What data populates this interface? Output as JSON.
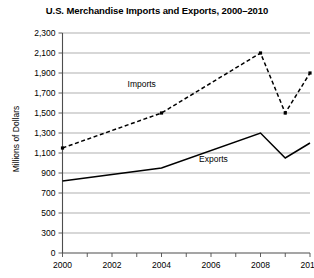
{
  "chart_data": {
    "type": "line",
    "title": "U.S. Merchandise Imports and Exports, 2000–2010",
    "xlabel": "",
    "ylabel": "Millions of Dollars",
    "x": [
      2000,
      2004,
      2008,
      2009,
      2010
    ],
    "series": [
      {
        "name": "Imports",
        "style": "dashed",
        "values": [
          1150,
          1500,
          2100,
          1500,
          1900
        ]
      },
      {
        "name": "Exports",
        "style": "solid",
        "values": [
          820,
          950,
          1300,
          1050,
          1200
        ]
      }
    ],
    "ylim": [
      0,
      2300
    ],
    "yticks": [
      0,
      300,
      500,
      700,
      900,
      1100,
      1300,
      1500,
      1700,
      1900,
      2100,
      2300
    ],
    "ytick_labels": [
      "0",
      "300",
      "500",
      "700",
      "900",
      "1,100",
      "1,300",
      "1,500",
      "1,700",
      "1,900",
      "2,100",
      "2,300"
    ],
    "xlim": [
      2000,
      2010
    ],
    "xticks": [
      2000,
      2002,
      2004,
      2006,
      2008,
      2010
    ],
    "xtick_labels": [
      "2000",
      "2002",
      "2004",
      "2006",
      "2008",
      "2010"
    ],
    "xminor_ticks": [
      2001,
      2003,
      2005,
      2007,
      2009
    ],
    "grid": "horizontal",
    "legend": "inline-annotations",
    "annotations": [
      {
        "text": "Imports",
        "x": 2003.2,
        "y": 1760
      },
      {
        "text": "Exports",
        "x": 2006.1,
        "y": 1010
      }
    ],
    "colors": {
      "line": "#000000",
      "grid": "#8c8c8c",
      "axis": "#4d4d4d",
      "background": "#ffffff"
    }
  }
}
